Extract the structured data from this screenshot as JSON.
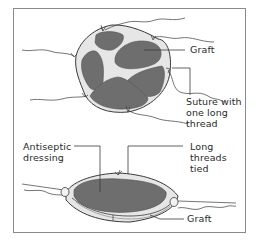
{
  "figure": {
    "top_panel": {
      "labels": {
        "graft": "Graft",
        "suture": "Suture with\none long\nthread"
      }
    },
    "bottom_panel": {
      "labels": {
        "dressing": "Antiseptic\ndressing",
        "threads": "Long\nthreads\ntied",
        "graft": "Graft"
      }
    },
    "colors": {
      "graft_fill": "#6e6e6e",
      "skin_fill": "#e6e6e6",
      "outline": "#3a3a3a",
      "frame": "#8a8a8a"
    }
  }
}
